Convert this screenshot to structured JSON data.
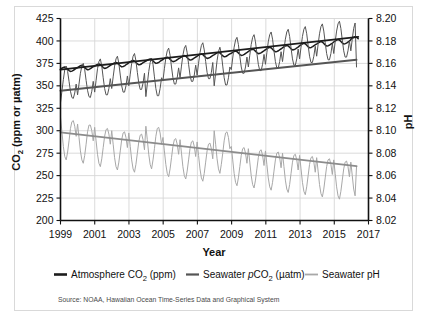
{
  "figure": {
    "frame_color": "#d9d9d9",
    "background": "#ffffff"
  },
  "source": {
    "text": "Source: NOAA, Hawaiian Ocean Time-Series Data and Graphical System"
  },
  "axes": {
    "x": {
      "label": "Year",
      "ticks": [
        "1999",
        "2001",
        "2003",
        "2005",
        "2007",
        "2009",
        "2011",
        "2013",
        "2015",
        "2017"
      ],
      "min": 1999,
      "max": 2017
    },
    "y_left": {
      "label_main": "CO",
      "label_sub": "2",
      "label_rest": " (ppm or µatm)",
      "label_full": "CO2 (ppm or µatm)",
      "ticks": [
        "425",
        "400",
        "375",
        "350",
        "325",
        "300",
        "275",
        "250",
        "225",
        "200"
      ],
      "min": 200,
      "max": 425,
      "step": 25
    },
    "y_right": {
      "label": "pH",
      "ticks": [
        "8.20",
        "8.18",
        "8.16",
        "8.14",
        "8.12",
        "8.10",
        "8.08",
        "8.06",
        "8.04",
        "8.02"
      ],
      "min": 8.02,
      "max": 8.2,
      "step": 0.02
    }
  },
  "legend": {
    "items": [
      {
        "label_pre": "Atmosphere CO",
        "label_sub": "2",
        "label_post": " (ppm)",
        "label_full": "Atmosphere CO2 (ppm)",
        "color": "#1c1c1c",
        "italic_prefix": ""
      },
      {
        "label_pre": "Seawater ",
        "italic_prefix": "p",
        "label_mid": "CO",
        "label_sub": "2",
        "label_post": " (µatm)",
        "label_full": "Seawater pCO2 (µatm)",
        "color": "#555555"
      },
      {
        "label_pre": "Seawater pH",
        "label_sub": "",
        "label_post": "",
        "label_full": "Seawater pH",
        "color": "#a8a8a8",
        "italic_prefix": ""
      }
    ]
  },
  "chart_data": {
    "type": "line",
    "title": "",
    "xlabel": "Year",
    "ylabel": "CO2 (ppm or µatm)",
    "ylabel_right": "pH",
    "xlim": [
      1999,
      2017
    ],
    "ylim": [
      200,
      425
    ],
    "ylim_right": [
      8.02,
      8.2
    ],
    "grid": true,
    "legend_position": "below-axes",
    "x_tick_step": 2,
    "series": [
      {
        "name": "Atmosphere CO2 (ppm)",
        "axis": "left",
        "color": "#1c1c1c",
        "units": "ppm",
        "trend_start": 368.0,
        "trend_end": 404.5,
        "seasonal_amplitude": 3.0,
        "x_start": 1999.0,
        "x_end": 2016.4,
        "monthly_values": [
          368.5,
          369.6,
          370.5,
          371.0,
          370.2,
          368.6,
          367.0,
          366.0,
          366.4,
          367.2,
          368.4,
          369.4,
          370.4,
          371.5,
          372.4,
          372.9,
          372.1,
          370.5,
          368.9,
          367.9,
          368.3,
          369.1,
          370.3,
          371.3,
          371.9,
          373.0,
          373.9,
          374.4,
          373.6,
          372.0,
          370.4,
          369.4,
          369.8,
          370.6,
          371.8,
          372.8,
          373.6,
          374.7,
          375.6,
          376.1,
          375.3,
          373.7,
          372.1,
          371.1,
          371.5,
          372.3,
          373.5,
          374.5,
          375.9,
          377.0,
          377.9,
          378.4,
          377.6,
          376.0,
          374.4,
          373.4,
          373.8,
          374.6,
          375.8,
          376.8,
          377.5,
          378.6,
          379.5,
          380.0,
          379.2,
          377.6,
          376.0,
          375.0,
          375.4,
          376.2,
          377.4,
          378.4,
          379.4,
          380.5,
          381.4,
          381.9,
          381.1,
          379.5,
          377.9,
          376.9,
          377.3,
          378.1,
          379.3,
          380.3,
          381.2,
          382.3,
          383.2,
          383.7,
          382.9,
          381.3,
          379.7,
          378.7,
          379.1,
          379.9,
          381.1,
          382.1,
          383.0,
          384.1,
          385.0,
          385.5,
          384.7,
          383.1,
          381.5,
          380.5,
          380.9,
          381.7,
          382.9,
          383.9,
          384.8,
          385.9,
          386.8,
          387.3,
          386.5,
          384.9,
          383.3,
          382.3,
          382.7,
          383.5,
          384.7,
          385.7,
          386.3,
          387.4,
          388.3,
          388.8,
          388.0,
          386.4,
          384.8,
          383.8,
          384.2,
          385.0,
          386.2,
          387.2,
          388.3,
          389.4,
          390.3,
          390.8,
          390.0,
          388.4,
          386.8,
          385.8,
          386.2,
          387.0,
          388.2,
          389.2,
          390.4,
          391.5,
          392.4,
          392.9,
          392.1,
          390.5,
          388.9,
          387.9,
          388.3,
          389.1,
          390.3,
          391.3,
          392.5,
          393.6,
          394.5,
          395.0,
          394.2,
          392.6,
          391.0,
          390.0,
          390.4,
          391.2,
          392.4,
          393.4,
          394.9,
          396.0,
          396.9,
          397.4,
          396.6,
          395.0,
          393.4,
          392.4,
          392.8,
          393.6,
          394.8,
          395.8,
          396.8,
          397.9,
          398.8,
          399.3,
          398.5,
          396.9,
          395.3,
          394.3,
          394.7,
          395.5,
          396.7,
          397.7,
          399.1,
          400.2,
          401.1,
          401.6,
          400.8,
          399.2,
          397.6,
          396.6,
          397.0,
          397.8,
          399.0,
          400.0,
          402.0,
          403.2,
          404.3,
          404.9,
          404.0,
          402.4
        ]
      },
      {
        "name": "Seawater pCO2 (µatm)",
        "axis": "left",
        "color": "#555555",
        "units": "µatm",
        "trend_start": 344.5,
        "trend_end": 379.0,
        "seasonal_amplitude": 17.0,
        "x_start": 1999.0,
        "x_end": 2016.3,
        "monthly_values": [
          331,
          344,
          357,
          368,
          372,
          366,
          355,
          344,
          337,
          336,
          342,
          352,
          340,
          352,
          364,
          372,
          375,
          368,
          356,
          345,
          338,
          337,
          344,
          355,
          343,
          356,
          369,
          377,
          380,
          372,
          359,
          347,
          340,
          340,
          347,
          358,
          347,
          360,
          372,
          380,
          383,
          375,
          362,
          350,
          343,
          343,
          350,
          361,
          350,
          363,
          375,
          383,
          386,
          378,
          365,
          353,
          346,
          346,
          353,
          364,
          338,
          352,
          366,
          376,
          381,
          374,
          360,
          347,
          339,
          339,
          347,
          359,
          356,
          369,
          381,
          389,
          392,
          384,
          371,
          359,
          352,
          352,
          359,
          370,
          359,
          372,
          384,
          392,
          395,
          387,
          374,
          362,
          355,
          355,
          362,
          373,
          362,
          375,
          387,
          395,
          398,
          390,
          377,
          365,
          358,
          358,
          365,
          376,
          350,
          364,
          378,
          388,
          393,
          386,
          372,
          359,
          351,
          351,
          359,
          371,
          368,
          381,
          393,
          401,
          404,
          396,
          383,
          371,
          364,
          364,
          371,
          382,
          371,
          384,
          396,
          404,
          407,
          399,
          386,
          374,
          367,
          367,
          374,
          385,
          374,
          387,
          399,
          407,
          410,
          402,
          389,
          377,
          370,
          370,
          377,
          388,
          377,
          390,
          402,
          410,
          413,
          405,
          392,
          380,
          373,
          373,
          380,
          391,
          380,
          393,
          405,
          413,
          416,
          408,
          395,
          383,
          376,
          376,
          383,
          394,
          383,
          396,
          408,
          416,
          419,
          411,
          398,
          386,
          379,
          379,
          386,
          397,
          386,
          399,
          411,
          419,
          422,
          414,
          401,
          389,
          382,
          382,
          389,
          400,
          389,
          402,
          414,
          420,
          371
        ]
      },
      {
        "name": "Seawater pH",
        "axis": "right",
        "color": "#a8a8a8",
        "units": "pH",
        "trend_start": 8.0985,
        "trend_end": 8.0685,
        "seasonal_amplitude": 0.012,
        "x_start": 1999.0,
        "x_end": 2016.3,
        "monthly_values": [
          8.112,
          8.099,
          8.086,
          8.077,
          8.074,
          8.081,
          8.091,
          8.102,
          8.108,
          8.109,
          8.104,
          8.095,
          8.106,
          8.094,
          8.082,
          8.074,
          8.071,
          8.078,
          8.088,
          8.099,
          8.105,
          8.105,
          8.1,
          8.091,
          8.103,
          8.091,
          8.079,
          8.071,
          8.068,
          8.075,
          8.085,
          8.095,
          8.101,
          8.102,
          8.097,
          8.088,
          8.1,
          8.088,
          8.076,
          8.068,
          8.065,
          8.072,
          8.082,
          8.092,
          8.098,
          8.099,
          8.094,
          8.085,
          8.098,
          8.086,
          8.074,
          8.066,
          8.063,
          8.07,
          8.08,
          8.09,
          8.096,
          8.097,
          8.092,
          8.083,
          8.104,
          8.092,
          8.079,
          8.07,
          8.066,
          8.074,
          8.084,
          8.095,
          8.102,
          8.103,
          8.098,
          8.088,
          8.094,
          8.082,
          8.07,
          8.062,
          8.059,
          8.066,
          8.076,
          8.086,
          8.092,
          8.093,
          8.088,
          8.079,
          8.092,
          8.08,
          8.068,
          8.06,
          8.057,
          8.064,
          8.074,
          8.084,
          8.09,
          8.091,
          8.086,
          8.077,
          8.09,
          8.078,
          8.066,
          8.058,
          8.055,
          8.062,
          8.072,
          8.082,
          8.088,
          8.089,
          8.084,
          8.075,
          8.1,
          8.088,
          8.075,
          8.066,
          8.062,
          8.07,
          8.08,
          8.091,
          8.098,
          8.099,
          8.094,
          8.084,
          8.086,
          8.074,
          8.062,
          8.054,
          8.051,
          8.058,
          8.068,
          8.078,
          8.084,
          8.085,
          8.08,
          8.071,
          8.084,
          8.072,
          8.06,
          8.052,
          8.049,
          8.056,
          8.066,
          8.076,
          8.082,
          8.083,
          8.078,
          8.069,
          8.082,
          8.07,
          8.058,
          8.05,
          8.047,
          8.054,
          8.064,
          8.074,
          8.08,
          8.081,
          8.076,
          8.067,
          8.08,
          8.068,
          8.056,
          8.048,
          8.045,
          8.052,
          8.062,
          8.072,
          8.078,
          8.079,
          8.074,
          8.065,
          8.078,
          8.066,
          8.054,
          8.046,
          8.043,
          8.05,
          8.06,
          8.07,
          8.076,
          8.077,
          8.072,
          8.063,
          8.076,
          8.064,
          8.052,
          8.044,
          8.041,
          8.048,
          8.058,
          8.068,
          8.074,
          8.075,
          8.07,
          8.061,
          8.074,
          8.062,
          8.05,
          8.042,
          8.039,
          8.046,
          8.056,
          8.066,
          8.072,
          8.073,
          8.068,
          8.059,
          8.072,
          8.06,
          8.048,
          8.042,
          8.068
        ]
      }
    ],
    "trendlines": [
      {
        "name": "Atmosphere CO2 trend",
        "axis": "left",
        "color": "#1c1c1c",
        "x0": 1999.0,
        "y0": 368.0,
        "x1": 2016.4,
        "y1": 404.5
      },
      {
        "name": "Seawater pCO2 trend",
        "axis": "left",
        "color": "#555555",
        "x0": 1999.0,
        "y0": 344.5,
        "x1": 2016.3,
        "y1": 379.0
      },
      {
        "name": "Seawater pH trend",
        "axis": "right",
        "color": "#8c8c8c",
        "x0": 1999.0,
        "y0": 8.0985,
        "x1": 2016.3,
        "y1": 8.0685
      }
    ]
  }
}
